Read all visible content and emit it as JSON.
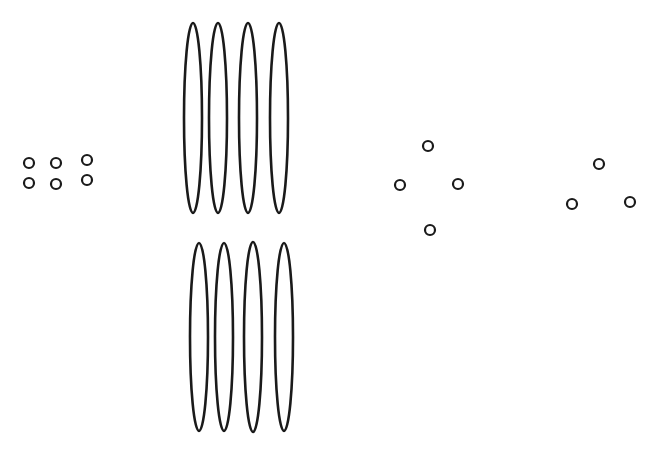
{
  "canvas": {
    "width": 661,
    "height": 456,
    "background": "#ffffff",
    "stroke": "#1a1a1a"
  },
  "groups": [
    {
      "name": "small-circle-grid",
      "shape": "circle",
      "count": 6,
      "arrangement": "2 rows x 3 columns",
      "items": [
        {
          "cx": 29,
          "cy": 163,
          "r": 5
        },
        {
          "cx": 56,
          "cy": 163,
          "r": 5
        },
        {
          "cx": 87,
          "cy": 160,
          "r": 5
        },
        {
          "cx": 29,
          "cy": 183,
          "r": 5
        },
        {
          "cx": 56,
          "cy": 184,
          "r": 5
        },
        {
          "cx": 87,
          "cy": 180,
          "r": 5
        }
      ]
    },
    {
      "name": "ellipse-row-top",
      "shape": "ellipse",
      "count": 4,
      "items": [
        {
          "cx": 193,
          "cy": 118,
          "rx": 9,
          "ry": 95
        },
        {
          "cx": 218,
          "cy": 118,
          "rx": 9,
          "ry": 95
        },
        {
          "cx": 248,
          "cy": 118,
          "rx": 9,
          "ry": 95
        },
        {
          "cx": 279,
          "cy": 118,
          "rx": 9,
          "ry": 95
        }
      ]
    },
    {
      "name": "ellipse-row-bottom",
      "shape": "ellipse",
      "count": 4,
      "items": [
        {
          "cx": 199,
          "cy": 337,
          "rx": 9,
          "ry": 94
        },
        {
          "cx": 224,
          "cy": 337,
          "rx": 9,
          "ry": 94
        },
        {
          "cx": 253,
          "cy": 337,
          "rx": 9,
          "ry": 95
        },
        {
          "cx": 284,
          "cy": 337,
          "rx": 9,
          "ry": 94
        }
      ]
    },
    {
      "name": "diamond-circles",
      "shape": "circle",
      "count": 4,
      "arrangement": "diamond",
      "items": [
        {
          "cx": 428,
          "cy": 146,
          "r": 5
        },
        {
          "cx": 400,
          "cy": 185,
          "r": 5
        },
        {
          "cx": 458,
          "cy": 184,
          "r": 5
        },
        {
          "cx": 430,
          "cy": 230,
          "r": 5
        }
      ]
    },
    {
      "name": "triangle-circles",
      "shape": "circle",
      "count": 3,
      "arrangement": "triangle",
      "items": [
        {
          "cx": 599,
          "cy": 164,
          "r": 5
        },
        {
          "cx": 572,
          "cy": 204,
          "r": 5
        },
        {
          "cx": 630,
          "cy": 202,
          "r": 5
        }
      ]
    }
  ]
}
